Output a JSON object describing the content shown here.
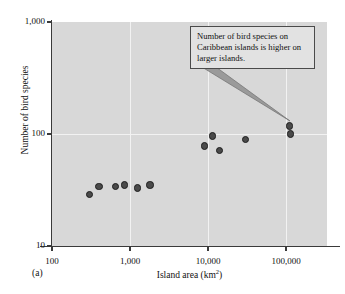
{
  "figure": {
    "panel_label": "(a)"
  },
  "annotation": {
    "text": "Number of bird species on Caribbean islands is higher on larger islands."
  },
  "chart_data": {
    "type": "scatter",
    "title": "",
    "subtitle": "",
    "xlabel": "Island area (km",
    "xlabel_sup": "2",
    "xlabel_suffix": ")",
    "xlabel_full": "Island area (km2)",
    "ylabel": "Number of bird species",
    "xscale": "log",
    "yscale": "log",
    "xlim": [
      100,
      300000
    ],
    "ylim": [
      10,
      1000
    ],
    "xticks": [
      100,
      1000,
      10000,
      100000
    ],
    "xtick_labels": [
      "100",
      "1,000",
      "10,000",
      "100,000"
    ],
    "yticks": [
      10,
      100,
      1000
    ],
    "ytick_labels": [
      "10",
      "100",
      "1,000"
    ],
    "grid": "major-xy",
    "grid_color": "#f2f2f2",
    "plot_bg_color": "#d8d8d8",
    "legend": "none",
    "marker_color": "#4a4a4a",
    "marker_edge_color": "#1d1d1d",
    "series": [
      {
        "name": "Caribbean islands",
        "points": [
          {
            "x": 300,
            "y": 29
          },
          {
            "x": 400,
            "y": 34
          },
          {
            "x": 650,
            "y": 34
          },
          {
            "x": 850,
            "y": 35
          },
          {
            "x": 1250,
            "y": 33
          },
          {
            "x": 1800,
            "y": 35
          },
          {
            "x": 9000,
            "y": 78
          },
          {
            "x": 11500,
            "y": 96
          },
          {
            "x": 14000,
            "y": 71
          },
          {
            "x": 30000,
            "y": 89
          },
          {
            "x": 110000,
            "y": 118
          },
          {
            "x": 115000,
            "y": 100
          }
        ]
      }
    ],
    "annotations": [
      {
        "text": "Number of bird species on Caribbean islands is higher on larger islands.",
        "points_to": {
          "x": 110000,
          "y": 118
        }
      }
    ]
  }
}
